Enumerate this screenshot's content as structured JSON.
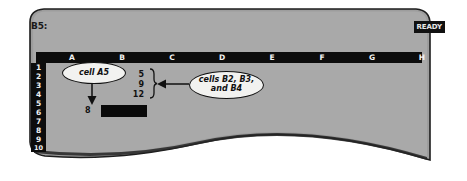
{
  "app": {
    "kind": "spreadsheet-screen",
    "cell_reference": "B5:",
    "mode_indicator": "READY"
  },
  "colors": {
    "bezel": "#9e9e9e",
    "screen_background": "#a8a8a8",
    "header_black": "#0c0c0c",
    "header_text": "#f2f2f2",
    "callout_fill": "#f2f2f0",
    "ink": "#111111"
  },
  "grid": {
    "column_headers": [
      "A",
      "B",
      "C",
      "D",
      "E",
      "F",
      "G",
      "H"
    ],
    "row_headers": [
      "1",
      "2",
      "3",
      "4",
      "5",
      "6",
      "7",
      "8",
      "9",
      "10"
    ],
    "cells": [
      {
        "ref": "B2",
        "value": "5"
      },
      {
        "ref": "B3",
        "value": "9"
      },
      {
        "ref": "B4",
        "value": "12"
      },
      {
        "ref": "A5",
        "value": "8"
      }
    ],
    "selected_cell": "B5"
  },
  "annotations": [
    {
      "id": "cell-a5",
      "text": "cell A5",
      "points_to": "A5"
    },
    {
      "id": "cells-b2-b3-b4",
      "line1": "cells B2, B3,",
      "line2": "and B4",
      "points_to": "B2:B4"
    }
  ]
}
